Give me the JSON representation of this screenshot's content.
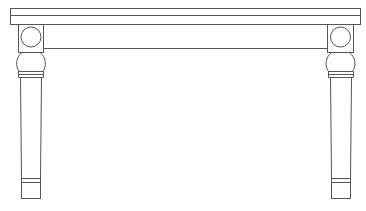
{
  "drawing": {
    "subject": "table-front-elevation",
    "stroke_color": "#555555",
    "background": "#ffffff",
    "parts": {
      "top": {
        "x1": 10.5,
        "x2": 360.5,
        "y_top": 8.5,
        "y_mid": 15.5,
        "y_bottom": 24.5
      },
      "apron": {
        "y_bottom": 48.5
      },
      "legs": [
        {
          "side": "left",
          "block_x1": 18.5,
          "block_x2": 43.5,
          "cx": 31
        },
        {
          "side": "right",
          "block_x1": 327.5,
          "block_x2": 353.5,
          "cx": 340.5
        }
      ]
    }
  }
}
